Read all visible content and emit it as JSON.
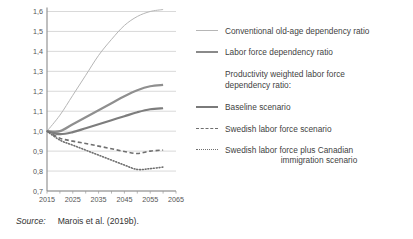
{
  "source": {
    "label": "Source:",
    "text": "Marois et al. (2019b)."
  },
  "legend": {
    "items": [
      {
        "key": "thin-line",
        "label": "Conventional old-age dependency ratio"
      },
      {
        "key": "thick-line",
        "label": "Labor force dependency ratio"
      }
    ],
    "group_heading_line1": "Productivity weighted labor force",
    "group_heading_line2": "dependency ratio:",
    "group_items": [
      {
        "key": "solid-line",
        "label": "Baseline scenario",
        "label2": ""
      },
      {
        "key": "dashed-line",
        "label": "Swedish labor force scenario",
        "label2": ""
      },
      {
        "key": "dotted-line",
        "label": "Swedish labor force plus Canadian",
        "label2": "immigration scenario"
      }
    ]
  },
  "chart_data": {
    "type": "line",
    "title": "",
    "xlabel": "",
    "ylabel": "",
    "xlim": [
      2015,
      2065
    ],
    "ylim": [
      0.7,
      1.6
    ],
    "xticks": [
      "2015",
      "2025",
      "2035",
      "2045",
      "2055",
      "2065"
    ],
    "xtick_values": [
      2015,
      2025,
      2035,
      2045,
      2055,
      2065
    ],
    "yticks": [
      "0,7",
      "0,8",
      "0,9",
      "1,0",
      "1,1",
      "1,2",
      "1,3",
      "1,4",
      "1,5",
      "1,6"
    ],
    "ytick_values": [
      0.7,
      0.8,
      0.9,
      1.0,
      1.1,
      1.2,
      1.3,
      1.4,
      1.5,
      1.6
    ],
    "grid": "horizontal",
    "legend_position": "right",
    "x": [
      2015,
      2020,
      2025,
      2030,
      2035,
      2040,
      2045,
      2050,
      2055,
      2060
    ],
    "series": [
      {
        "name": "Conventional old-age dependency ratio",
        "style": "thin-solid",
        "color": "#b6b6b6",
        "width": 1.0,
        "values": [
          1.0,
          1.08,
          1.18,
          1.28,
          1.38,
          1.46,
          1.53,
          1.575,
          1.6,
          1.61
        ]
      },
      {
        "name": "Labor force dependency ratio",
        "style": "solid",
        "color": "#8f8f8f",
        "width": 2.2,
        "values": [
          1.0,
          1.0,
          1.035,
          1.07,
          1.105,
          1.14,
          1.175,
          1.205,
          1.225,
          1.232
        ]
      },
      {
        "name": "Baseline scenario",
        "style": "solid",
        "color": "#7d7d7d",
        "width": 2.2,
        "values": [
          1.0,
          0.985,
          0.995,
          1.015,
          1.035,
          1.055,
          1.075,
          1.095,
          1.11,
          1.115
        ]
      },
      {
        "name": "Swedish labor force scenario",
        "style": "dashed",
        "color": "#6f6f6f",
        "width": 1.6,
        "values": [
          1.0,
          0.965,
          0.95,
          0.938,
          0.925,
          0.912,
          0.898,
          0.888,
          0.9,
          0.905
        ]
      },
      {
        "name": "Swedish labor force plus Canadian immigration scenario",
        "style": "dotted",
        "color": "#6f6f6f",
        "width": 1.6,
        "values": [
          1.0,
          0.955,
          0.93,
          0.905,
          0.88,
          0.855,
          0.83,
          0.808,
          0.812,
          0.82
        ]
      }
    ]
  }
}
